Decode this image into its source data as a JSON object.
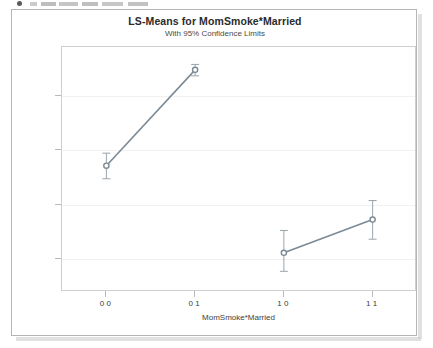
{
  "window": {
    "top_fragment_note": "cut-off text fragment",
    "panel_border_color": "#b5b5b5",
    "background": "#ffffff"
  },
  "chart_data": {
    "type": "line",
    "title": "LS-Means for MomSmoke*Married",
    "subtitle": "With 95% Confidence Limits",
    "xlabel": "MomSmoke*Married",
    "ylabel": "Infant Birth Weight LS-Mean",
    "categories": [
      "0 0",
      "0 1",
      "1 0",
      "1 1"
    ],
    "values": [
      3272,
      3448,
      3112,
      3173
    ],
    "error_low": [
      3248,
      3437,
      3078,
      3137
    ],
    "error_high": [
      3295,
      3458,
      3153,
      3208
    ],
    "segments": [
      [
        0,
        1
      ],
      [
        2,
        3
      ]
    ],
    "ylim": [
      3040,
      3490
    ],
    "yticks": [
      3100,
      3200,
      3300,
      3400
    ],
    "ytick_labels": [
      "3100",
      "3200",
      "3300",
      "3400"
    ],
    "xlim": [
      -0.5,
      3.5
    ],
    "xticks": [
      0,
      1,
      2,
      3
    ],
    "grid": true,
    "legend": "none",
    "series_color": "#7b8a96",
    "marker_color": "#7b8a96",
    "errorbar_color": "#9aa4ac",
    "grid_color": "#f1f1f1",
    "frame_color": "#cfcfcf"
  }
}
